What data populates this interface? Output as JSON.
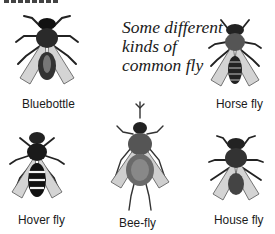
{
  "caption": {
    "lines": [
      "Some different",
      "kinds of",
      "common fly"
    ]
  },
  "flies": [
    {
      "name": "Bluebottle",
      "icon": "bluebottle-illustration"
    },
    {
      "name": "Horse fly",
      "icon": "horse-fly-illustration"
    },
    {
      "name": "Hover fly",
      "icon": "hover-fly-illustration"
    },
    {
      "name": "Bee-fly",
      "icon": "bee-fly-illustration"
    },
    {
      "name": "House fly",
      "icon": "house-fly-illustration"
    }
  ],
  "colors": {
    "ink": "#1a1a1a",
    "wing": "#d9d9d9",
    "background": "#ffffff"
  }
}
